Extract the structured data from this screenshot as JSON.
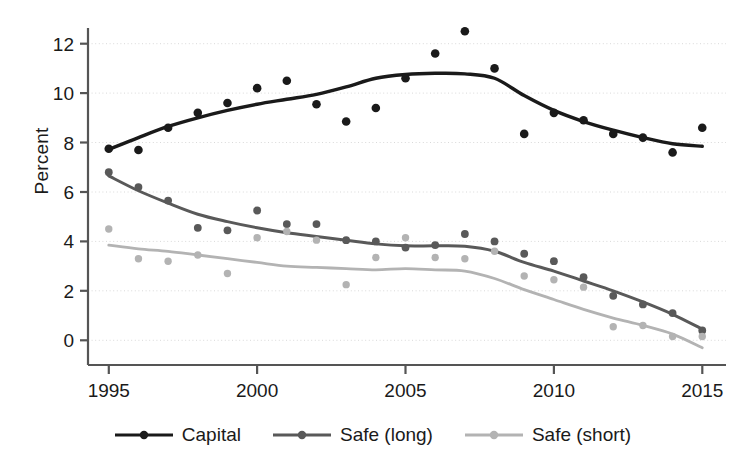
{
  "chart_data": {
    "type": "scatter",
    "title": "",
    "xlabel": "",
    "ylabel": "Percent",
    "grid": true,
    "xlim": [
      1994.3,
      2015.8
    ],
    "ylim": [
      -1.0,
      13.2
    ],
    "x_ticks": [
      1995,
      2000,
      2005,
      2010,
      2015
    ],
    "y_ticks": [
      0,
      2,
      4,
      6,
      8,
      10,
      12
    ],
    "legend_position": "bottom",
    "x": [
      1995,
      1996,
      1997,
      1998,
      1999,
      2000,
      2001,
      2002,
      2003,
      2004,
      2005,
      2006,
      2007,
      2008,
      2009,
      2010,
      2011,
      2012,
      2013,
      2014,
      2015
    ],
    "series": [
      {
        "name": "Capital",
        "color": "#1a1a1a",
        "marker": "circle",
        "values": [
          7.75,
          7.7,
          8.6,
          9.2,
          9.6,
          10.2,
          10.5,
          9.55,
          8.85,
          9.4,
          10.6,
          11.6,
          12.5,
          11.0,
          8.35,
          9.2,
          8.9,
          8.35,
          8.2,
          7.6,
          8.6
        ],
        "smoothed": [
          7.72,
          8.2,
          8.65,
          9.0,
          9.3,
          9.55,
          9.75,
          9.95,
          10.25,
          10.6,
          10.75,
          10.8,
          10.78,
          10.6,
          9.9,
          9.3,
          8.85,
          8.5,
          8.2,
          7.95,
          7.85
        ]
      },
      {
        "name": "Safe (long)",
        "color": "#595959",
        "marker": "circle",
        "values": [
          6.8,
          6.2,
          5.65,
          4.55,
          4.45,
          5.25,
          4.7,
          4.7,
          4.05,
          4.0,
          3.75,
          3.85,
          4.3,
          4.0,
          3.5,
          3.2,
          2.55,
          1.8,
          1.45,
          1.1,
          0.4
        ],
        "smoothed": [
          6.65,
          6.05,
          5.55,
          5.1,
          4.8,
          4.55,
          4.35,
          4.2,
          4.05,
          3.9,
          3.82,
          3.82,
          3.8,
          3.6,
          3.15,
          2.8,
          2.4,
          2.0,
          1.55,
          1.05,
          0.45
        ]
      },
      {
        "name": "Safe (short)",
        "color": "#b3b3b3",
        "marker": "circle",
        "values": [
          4.5,
          3.3,
          3.2,
          3.45,
          2.7,
          4.15,
          4.4,
          4.05,
          2.25,
          3.35,
          4.15,
          3.35,
          3.3,
          3.6,
          2.6,
          2.45,
          2.15,
          0.55,
          0.6,
          0.15,
          0.15
        ],
        "smoothed": [
          3.85,
          3.7,
          3.6,
          3.45,
          3.3,
          3.15,
          3.0,
          2.95,
          2.9,
          2.85,
          2.9,
          2.85,
          2.8,
          2.5,
          2.05,
          1.65,
          1.25,
          0.9,
          0.6,
          0.25,
          -0.3
        ]
      }
    ]
  },
  "axes": {
    "y_label": "Percent",
    "y_tick_labels": [
      "12",
      "10",
      "8",
      "6",
      "4",
      "2",
      "0"
    ],
    "x_tick_labels": [
      "1995",
      "2000",
      "2005",
      "2010",
      "2015"
    ]
  },
  "legend": {
    "items": [
      {
        "label": "Capital",
        "color": "#1a1a1a"
      },
      {
        "label": "Safe (long)",
        "color": "#595959"
      },
      {
        "label": "Safe (short)",
        "color": "#b3b3b3"
      }
    ]
  }
}
